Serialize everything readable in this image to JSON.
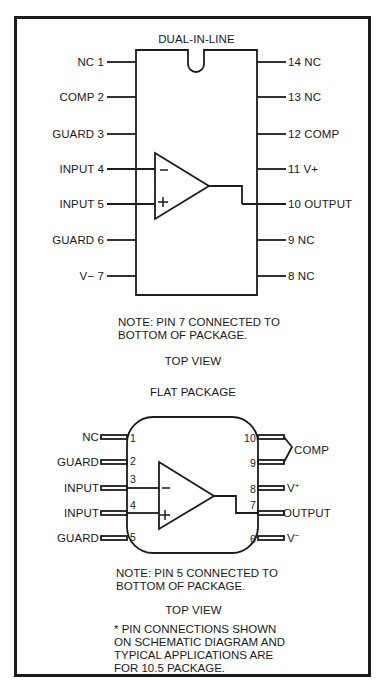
{
  "dip": {
    "title": "DUAL-IN-LINE",
    "left_pins": [
      {
        "label": "NC 1",
        "num": 1,
        "name": "NC"
      },
      {
        "label": "COMP 2",
        "num": 2,
        "name": "COMP"
      },
      {
        "label": "GUARD 3",
        "num": 3,
        "name": "GUARD"
      },
      {
        "label": "INPUT 4",
        "num": 4,
        "name": "INPUT"
      },
      {
        "label": "INPUT 5",
        "num": 5,
        "name": "INPUT"
      },
      {
        "label": "GUARD 6",
        "num": 6,
        "name": "GUARD"
      },
      {
        "label": "V− 7",
        "num": 7,
        "name": "V-"
      }
    ],
    "right_pins": [
      {
        "label": "14 NC",
        "num": 14,
        "name": "NC"
      },
      {
        "label": "13 NC",
        "num": 13,
        "name": "NC"
      },
      {
        "label": "12 COMP",
        "num": 12,
        "name": "COMP"
      },
      {
        "label": "11 V+",
        "num": 11,
        "name": "V+"
      },
      {
        "label": "10 OUTPUT",
        "num": 10,
        "name": "OUTPUT"
      },
      {
        "label": "9 NC",
        "num": 9,
        "name": "NC"
      },
      {
        "label": "8 NC",
        "num": 8,
        "name": "NC"
      }
    ],
    "inverting_symbol": "−",
    "noninverting_symbol": "+",
    "note": "NOTE: PIN 7 CONNECTED TO\nBOTTOM OF PACKAGE.",
    "view": "TOP VIEW"
  },
  "flat": {
    "title": "FLAT PACKAGE",
    "left_pins": [
      {
        "name": "NC",
        "num": "1"
      },
      {
        "name": "GUARD",
        "num": "2"
      },
      {
        "name": "INPUT",
        "num": "3"
      },
      {
        "name": "INPUT",
        "num": "4"
      },
      {
        "name": "GUARD",
        "num": "5"
      }
    ],
    "right_pins": [
      {
        "name": "COMP",
        "num": "10"
      },
      {
        "name": "COMP",
        "num": "9"
      },
      {
        "name": "V+",
        "num": "8"
      },
      {
        "name": "OUTPUT",
        "num": "7"
      },
      {
        "name": "V−",
        "num": "6"
      }
    ],
    "comp_label": "COMP",
    "vplus_label": "V",
    "vplus_sup": "+",
    "output_label": "OUTPUT",
    "vminus_label": "V",
    "vminus_sup": "−",
    "inverting_symbol": "−",
    "noninverting_symbol": "+",
    "note": "NOTE: PIN 5 CONNECTED TO\nBOTTOM OF PACKAGE.",
    "view": "TOP VIEW"
  },
  "footnote": "* PIN CONNECTIONS SHOWN\nON SCHEMATIC DIAGRAM AND\nTYPICAL APPLICATIONS ARE\nFOR 10.5 PACKAGE.",
  "colors": {
    "ink": "#1c1c1c",
    "paper": "#ffffff"
  }
}
